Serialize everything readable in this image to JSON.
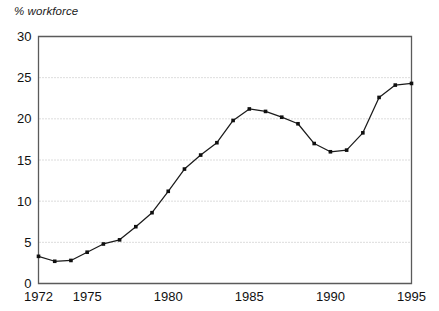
{
  "axis_label": "% workforce",
  "chart_data": {
    "type": "line",
    "title": "",
    "subtitle": "",
    "xlabel": "",
    "ylabel": "% workforce",
    "grid": true,
    "legend": false,
    "legend_position": "none",
    "xlim": [
      1972,
      1995
    ],
    "ylim": [
      0,
      30
    ],
    "x_tick_labels": [
      "1972",
      "1975",
      "1980",
      "1985",
      "1990",
      "1995"
    ],
    "x_ticks": [
      1972,
      1975,
      1980,
      1985,
      1990,
      1995
    ],
    "y_tick_labels": [
      "0",
      "5",
      "10",
      "15",
      "20",
      "25",
      "30"
    ],
    "y_ticks": [
      0,
      5,
      10,
      15,
      20,
      25,
      30
    ],
    "marker": "square",
    "line_color": "#1b1b1b",
    "marker_color": "#101010",
    "grid_color": "#b9b9b9",
    "axis_color": "#5a5a5a",
    "x": [
      1972,
      1973,
      1974,
      1975,
      1976,
      1977,
      1978,
      1979,
      1980,
      1981,
      1982,
      1983,
      1984,
      1985,
      1986,
      1987,
      1988,
      1989,
      1990,
      1991,
      1992,
      1993,
      1994,
      1995
    ],
    "values": [
      3.3,
      2.7,
      2.8,
      3.8,
      4.8,
      5.3,
      6.9,
      8.6,
      11.2,
      13.9,
      15.6,
      17.1,
      19.8,
      21.2,
      20.9,
      20.2,
      19.4,
      17.0,
      16.0,
      16.2,
      18.3,
      22.6,
      24.1,
      24.3
    ]
  }
}
